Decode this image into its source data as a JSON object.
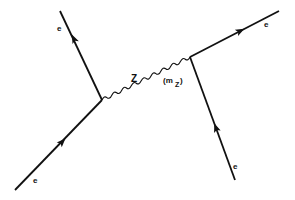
{
  "diagram": {
    "type": "feynman",
    "labels": {
      "e_top_left": "e",
      "e_bottom_left": "e",
      "e_top_right": "e",
      "e_bottom_right": "e",
      "boson": "Z",
      "mass_open": "(m",
      "mass_sub": "Z",
      "mass_close": ")"
    },
    "colors": {
      "line": "#111111",
      "background": "#ffffff"
    },
    "vertices": [
      {
        "name": "left-vertex",
        "x": 102,
        "y": 100
      },
      {
        "name": "right-vertex",
        "x": 190,
        "y": 57
      }
    ],
    "edges": [
      {
        "name": "electron-top-left",
        "from": "left-vertex",
        "to": [
          60,
          11
        ],
        "type": "fermion"
      },
      {
        "name": "electron-bottom-left",
        "from": [
          15,
          190
        ],
        "to": "left-vertex",
        "type": "fermion"
      },
      {
        "name": "electron-top-right",
        "from": "right-vertex",
        "to": [
          279,
          11
        ],
        "type": "fermion"
      },
      {
        "name": "electron-bottom-right",
        "from": [
          235,
          180
        ],
        "to": "right-vertex",
        "type": "fermion"
      },
      {
        "name": "z-propagator",
        "from": "left-vertex",
        "to": "right-vertex",
        "type": "boson"
      }
    ]
  }
}
